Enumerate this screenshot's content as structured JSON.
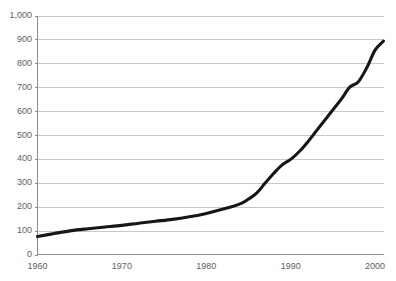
{
  "top_caption": {
    "text": "· ·  ··  · ·  · ···  · · ·  ·  ··  ····  · ·  · ·· ·  ·",
    "note": "clipped caption row"
  },
  "chart_data": {
    "type": "line",
    "title": "",
    "subtitle": "",
    "xlabel": "",
    "ylabel": "",
    "xlim": [
      1960,
      2001
    ],
    "ylim": [
      0,
      1000
    ],
    "grid": "horizontal",
    "legend": "none",
    "x_tick_labels": [
      "1960",
      "1970",
      "1980",
      "1990",
      "2000"
    ],
    "x_tick_values": [
      1960,
      1970,
      1980,
      1990,
      2000
    ],
    "y_tick_labels": [
      "0",
      "100",
      "200",
      "300",
      "400",
      "500",
      "600",
      "700",
      "800",
      "900",
      "1,000"
    ],
    "y_tick_values": [
      0,
      100,
      200,
      300,
      400,
      500,
      600,
      700,
      800,
      900,
      1000
    ],
    "line_color": "#161616",
    "grid_color": "#c8c8c8",
    "axis_color": "#8a8a8a",
    "series": [
      {
        "name": "series-1",
        "x": [
          1960,
          1962,
          1964,
          1966,
          1968,
          1970,
          1972,
          1974,
          1976,
          1978,
          1980,
          1982,
          1984,
          1985,
          1986,
          1987,
          1988,
          1989,
          1990,
          1991,
          1992,
          1993,
          1994,
          1995,
          1996,
          1997,
          1998,
          1999,
          2000,
          2001
        ],
        "values": [
          75,
          88,
          100,
          108,
          115,
          122,
          131,
          139,
          147,
          158,
          172,
          190,
          212,
          232,
          258,
          300,
          340,
          375,
          398,
          430,
          470,
          515,
          560,
          605,
          650,
          700,
          722,
          780,
          855,
          893
        ]
      }
    ]
  }
}
